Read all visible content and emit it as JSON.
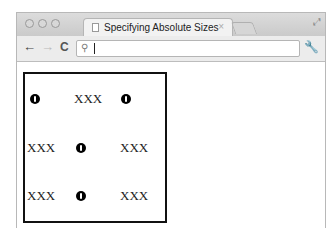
{
  "browser": {
    "tab": {
      "title": "Specifying Absolute Sizes",
      "close": "×"
    },
    "nav": {
      "back": "←",
      "forward": "→",
      "reload": "C"
    },
    "omnibox": {
      "value": "",
      "placeholder": ""
    },
    "icons": {
      "search": "🔍",
      "wrench": "🔧",
      "fullscreen": "⤢"
    }
  },
  "grid": {
    "rows": [
      [
        "dot",
        "XXX",
        "dot"
      ],
      [
        "XXX",
        "dot",
        "XXX"
      ],
      [
        "XXX",
        "dot",
        "XXX"
      ]
    ],
    "text": "XXX"
  }
}
